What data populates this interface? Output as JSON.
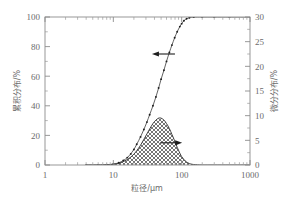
{
  "chart_data": {
    "type": "line",
    "title": "",
    "xlabel": "粒径/μm",
    "ylabel": "累积分布/%",
    "y2label": "微分分布/%",
    "xscale": "log",
    "xlim": [
      1,
      1000
    ],
    "ylim": [
      0,
      100
    ],
    "y2lim": [
      0,
      30
    ],
    "grid": false,
    "legend": "none",
    "xticks": [
      "1",
      "10",
      "100",
      "1000"
    ],
    "xtick_values": [
      1,
      10,
      100,
      1000
    ],
    "yticks": [
      "0",
      "20",
      "40",
      "60",
      "80",
      "100"
    ],
    "ytick_values": [
      0,
      20,
      40,
      60,
      80,
      100
    ],
    "y2ticks": [
      "0",
      "5",
      "10",
      "15",
      "20",
      "25",
      "30"
    ],
    "y2tick_values": [
      0,
      5,
      10,
      15,
      20,
      25,
      30
    ],
    "annotations": [
      {
        "name": "cumulative-arrow",
        "text": "",
        "glyph": "left-arrow",
        "points_to": "left-axis",
        "x": 38,
        "y": 75
      },
      {
        "name": "differential-arrow",
        "text": "",
        "glyph": "right-arrow",
        "points_to": "right-axis",
        "x": 95,
        "y": 4.5
      }
    ],
    "series": [
      {
        "name": "累积分布",
        "axis": "left",
        "style": "dotted-markers",
        "x": [
          4,
          6,
          8,
          10,
          12,
          14,
          16,
          18,
          20,
          22,
          25,
          28,
          31,
          34,
          38,
          42,
          46,
          50,
          55,
          60,
          66,
          72,
          79,
          86,
          94,
          100,
          108,
          118,
          130,
          150,
          200,
          300,
          500,
          1000
        ],
        "values": [
          0,
          0,
          0.2,
          0.6,
          1.5,
          3,
          5,
          7.5,
          10.5,
          14,
          19,
          24,
          29,
          34,
          40,
          46,
          52,
          58,
          64,
          70,
          76,
          81,
          86,
          90,
          93.5,
          95.5,
          97.5,
          98.8,
          99.5,
          99.9,
          100,
          100,
          100,
          100
        ]
      },
      {
        "name": "微分分布",
        "axis": "right",
        "style": "filled-crosshatch",
        "x": [
          4,
          6,
          8,
          10,
          12,
          14,
          16,
          18,
          20,
          22,
          25,
          28,
          31,
          34,
          38,
          42,
          46,
          50,
          55,
          60,
          66,
          72,
          79,
          86,
          94,
          100,
          108,
          118,
          130,
          150,
          200,
          300,
          500,
          1000
        ],
        "values": [
          0,
          0,
          0.05,
          0.15,
          0.35,
          0.7,
          1.1,
          1.6,
          2.2,
          2.9,
          4.0,
          5.2,
          6.3,
          7.3,
          8.4,
          9.1,
          9.5,
          9.5,
          9.1,
          8.4,
          7.4,
          6.2,
          4.9,
          3.6,
          2.4,
          1.7,
          1.1,
          0.6,
          0.3,
          0.1,
          0,
          0,
          0,
          0
        ]
      }
    ]
  },
  "colors": {
    "background": "#ffffff",
    "axis": "#8d8d8d",
    "text": "#6b6b6b",
    "curve": "#2f2f2f",
    "marker": "#1e1e1e"
  }
}
